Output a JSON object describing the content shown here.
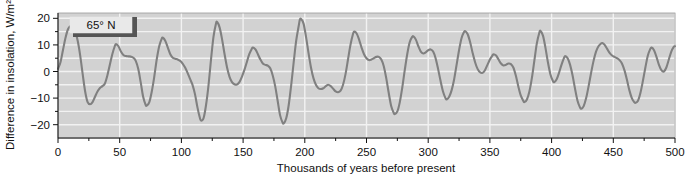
{
  "chart_data": {
    "type": "line",
    "title": "",
    "xlabel": "Thousands of years before present",
    "ylabel": "Difference in insolation, W/m²",
    "xlim": [
      0,
      500
    ],
    "ylim": [
      -25,
      22
    ],
    "xticks": [
      0,
      50,
      100,
      150,
      200,
      250,
      300,
      350,
      400,
      450,
      500
    ],
    "xtick_labels": [
      "0",
      "50",
      "100",
      "150",
      "200",
      "250",
      "300",
      "350",
      "400",
      "450",
      "500"
    ],
    "xminor_step": 25,
    "yticks": [
      -20,
      -10,
      0,
      10,
      20
    ],
    "ytick_labels": [
      "−20",
      "−10",
      "0",
      "10",
      "20"
    ],
    "yminor_step": 5,
    "grid": "horizontal-and-vertical-white-on-gray",
    "plot_background": "#d2d2d2",
    "grid_color": "#f2f2f2",
    "line_color": "#808080",
    "line_width": 2.1,
    "legend": {
      "position": "top-left-inside",
      "entries": [
        "65° N"
      ]
    },
    "annotations": [
      {
        "text": "65° N",
        "x": 22,
        "y": 17.5
      }
    ],
    "series": [
      {
        "name": "65° N",
        "points": [
          [
            0,
            1.0
          ],
          [
            2,
            3.5
          ],
          [
            4,
            8.0
          ],
          [
            6,
            12.5
          ],
          [
            8,
            15.8
          ],
          [
            10,
            17.0
          ],
          [
            12,
            16.8
          ],
          [
            14,
            15.0
          ],
          [
            16,
            11.5
          ],
          [
            18,
            6.0
          ],
          [
            20,
            -1.0
          ],
          [
            22,
            -7.5
          ],
          [
            24,
            -11.5
          ],
          [
            26,
            -12.3
          ],
          [
            28,
            -11.5
          ],
          [
            30,
            -9.5
          ],
          [
            32,
            -7.5
          ],
          [
            34,
            -6.2
          ],
          [
            36,
            -5.5
          ],
          [
            38,
            -4.5
          ],
          [
            40,
            -1.5
          ],
          [
            42,
            2.5
          ],
          [
            44,
            6.5
          ],
          [
            46,
            9.5
          ],
          [
            47,
            10.3
          ],
          [
            49,
            9.5
          ],
          [
            51,
            7.5
          ],
          [
            53,
            6.2
          ],
          [
            55,
            5.8
          ],
          [
            57,
            5.7
          ],
          [
            59,
            5.6
          ],
          [
            61,
            5.2
          ],
          [
            63,
            4.0
          ],
          [
            65,
            1.0
          ],
          [
            67,
            -4.0
          ],
          [
            69,
            -9.5
          ],
          [
            71,
            -12.5
          ],
          [
            72,
            -12.8
          ],
          [
            74,
            -11.5
          ],
          [
            76,
            -7.5
          ],
          [
            78,
            -2.0
          ],
          [
            80,
            4.5
          ],
          [
            82,
            9.5
          ],
          [
            84,
            12.3
          ],
          [
            85,
            12.7
          ],
          [
            87,
            11.5
          ],
          [
            89,
            9.0
          ],
          [
            91,
            6.5
          ],
          [
            93,
            5.2
          ],
          [
            95,
            4.8
          ],
          [
            97,
            4.5
          ],
          [
            99,
            4.0
          ],
          [
            101,
            3.0
          ],
          [
            103,
            1.5
          ],
          [
            105,
            -0.5
          ],
          [
            107,
            -2.8
          ],
          [
            109,
            -5.0
          ],
          [
            111,
            -8.5
          ],
          [
            113,
            -13.5
          ],
          [
            115,
            -17.5
          ],
          [
            116,
            -18.5
          ],
          [
            118,
            -17.5
          ],
          [
            120,
            -12.5
          ],
          [
            122,
            -5.0
          ],
          [
            124,
            4.5
          ],
          [
            126,
            13.0
          ],
          [
            128,
            18.0
          ],
          [
            129,
            18.6
          ],
          [
            131,
            16.5
          ],
          [
            133,
            12.0
          ],
          [
            135,
            6.5
          ],
          [
            137,
            1.5
          ],
          [
            139,
            -2.0
          ],
          [
            141,
            -4.0
          ],
          [
            143,
            -4.8
          ],
          [
            145,
            -4.9
          ],
          [
            147,
            -4.0
          ],
          [
            149,
            -2.0
          ],
          [
            151,
            0.5
          ],
          [
            153,
            3.5
          ],
          [
            155,
            6.5
          ],
          [
            157,
            8.5
          ],
          [
            158,
            9.0
          ],
          [
            160,
            8.3
          ],
          [
            162,
            6.5
          ],
          [
            164,
            4.5
          ],
          [
            166,
            3.0
          ],
          [
            168,
            2.5
          ],
          [
            170,
            2.2
          ],
          [
            172,
            1.2
          ],
          [
            174,
            -1.5
          ],
          [
            176,
            -5.5
          ],
          [
            178,
            -11.0
          ],
          [
            180,
            -16.5
          ],
          [
            182,
            -19.2
          ],
          [
            183,
            -19.5
          ],
          [
            185,
            -17.5
          ],
          [
            187,
            -12.5
          ],
          [
            189,
            -5.0
          ],
          [
            191,
            3.5
          ],
          [
            193,
            11.5
          ],
          [
            195,
            17.0
          ],
          [
            196,
            19.5
          ],
          [
            197,
            19.8
          ],
          [
            199,
            18.0
          ],
          [
            201,
            13.0
          ],
          [
            203,
            7.0
          ],
          [
            205,
            1.5
          ],
          [
            207,
            -2.5
          ],
          [
            209,
            -5.0
          ],
          [
            211,
            -6.3
          ],
          [
            213,
            -6.6
          ],
          [
            215,
            -6.3
          ],
          [
            217,
            -5.5
          ],
          [
            219,
            -5.0
          ],
          [
            221,
            -5.5
          ],
          [
            223,
            -6.5
          ],
          [
            225,
            -7.5
          ],
          [
            227,
            -7.8
          ],
          [
            229,
            -7.2
          ],
          [
            231,
            -5.0
          ],
          [
            233,
            -1.0
          ],
          [
            235,
            4.5
          ],
          [
            237,
            10.0
          ],
          [
            239,
            14.0
          ],
          [
            240,
            15.0
          ],
          [
            242,
            14.3
          ],
          [
            244,
            12.0
          ],
          [
            246,
            9.0
          ],
          [
            248,
            6.5
          ],
          [
            250,
            5.0
          ],
          [
            252,
            4.3
          ],
          [
            254,
            4.5
          ],
          [
            256,
            5.0
          ],
          [
            258,
            5.5
          ],
          [
            260,
            5.5
          ],
          [
            262,
            4.5
          ],
          [
            264,
            2.0
          ],
          [
            266,
            -2.5
          ],
          [
            268,
            -8.0
          ],
          [
            270,
            -13.0
          ],
          [
            272,
            -15.5
          ],
          [
            273,
            -16.0
          ],
          [
            275,
            -15.0
          ],
          [
            277,
            -11.5
          ],
          [
            279,
            -6.0
          ],
          [
            281,
            0.5
          ],
          [
            283,
            6.5
          ],
          [
            285,
            11.0
          ],
          [
            287,
            13.0
          ],
          [
            288,
            13.2
          ],
          [
            290,
            12.0
          ],
          [
            292,
            9.5
          ],
          [
            294,
            7.5
          ],
          [
            296,
            6.8
          ],
          [
            298,
            7.2
          ],
          [
            300,
            8.0
          ],
          [
            302,
            8.3
          ],
          [
            304,
            7.5
          ],
          [
            306,
            5.0
          ],
          [
            308,
            1.0
          ],
          [
            310,
            -3.5
          ],
          [
            312,
            -7.5
          ],
          [
            314,
            -10.0
          ],
          [
            315,
            -10.5
          ],
          [
            317,
            -9.5
          ],
          [
            319,
            -7.0
          ],
          [
            321,
            -3.0
          ],
          [
            323,
            2.5
          ],
          [
            325,
            8.0
          ],
          [
            327,
            12.5
          ],
          [
            329,
            14.8
          ],
          [
            330,
            15.2
          ],
          [
            332,
            14.0
          ],
          [
            334,
            11.0
          ],
          [
            336,
            7.0
          ],
          [
            338,
            3.5
          ],
          [
            340,
            1.0
          ],
          [
            342,
            -0.3
          ],
          [
            344,
            -0.5
          ],
          [
            346,
            0.5
          ],
          [
            348,
            2.5
          ],
          [
            350,
            4.5
          ],
          [
            352,
            6.0
          ],
          [
            353,
            6.5
          ],
          [
            355,
            6.0
          ],
          [
            357,
            4.5
          ],
          [
            359,
            3.0
          ],
          [
            361,
            2.3
          ],
          [
            363,
            2.5
          ],
          [
            365,
            3.0
          ],
          [
            367,
            2.8
          ],
          [
            369,
            1.5
          ],
          [
            371,
            -1.5
          ],
          [
            373,
            -5.5
          ],
          [
            375,
            -9.0
          ],
          [
            377,
            -11.0
          ],
          [
            378,
            -11.5
          ],
          [
            380,
            -10.5
          ],
          [
            382,
            -7.5
          ],
          [
            384,
            -2.5
          ],
          [
            386,
            4.0
          ],
          [
            388,
            10.5
          ],
          [
            390,
            14.5
          ],
          [
            391,
            15.3
          ],
          [
            393,
            13.5
          ],
          [
            395,
            9.0
          ],
          [
            397,
            3.5
          ],
          [
            399,
            -1.0
          ],
          [
            401,
            -3.5
          ],
          [
            402,
            -4.0
          ],
          [
            404,
            -3.0
          ],
          [
            406,
            -0.5
          ],
          [
            408,
            2.5
          ],
          [
            410,
            5.0
          ],
          [
            411,
            5.8
          ],
          [
            413,
            5.0
          ],
          [
            415,
            2.5
          ],
          [
            417,
            -1.5
          ],
          [
            419,
            -6.5
          ],
          [
            421,
            -11.0
          ],
          [
            423,
            -13.5
          ],
          [
            424,
            -14.0
          ],
          [
            426,
            -13.0
          ],
          [
            428,
            -10.0
          ],
          [
            430,
            -5.5
          ],
          [
            432,
            -0.5
          ],
          [
            434,
            4.0
          ],
          [
            436,
            7.5
          ],
          [
            438,
            9.5
          ],
          [
            440,
            10.5
          ],
          [
            441,
            10.7
          ],
          [
            443,
            10.0
          ],
          [
            445,
            8.5
          ],
          [
            447,
            7.0
          ],
          [
            449,
            6.0
          ],
          [
            451,
            5.5
          ],
          [
            453,
            5.0
          ],
          [
            455,
            4.3
          ],
          [
            457,
            3.0
          ],
          [
            459,
            0.5
          ],
          [
            461,
            -3.0
          ],
          [
            463,
            -7.0
          ],
          [
            465,
            -10.0
          ],
          [
            467,
            -11.5
          ],
          [
            468,
            -11.8
          ],
          [
            470,
            -11.0
          ],
          [
            472,
            -8.0
          ],
          [
            474,
            -3.5
          ],
          [
            476,
            1.5
          ],
          [
            478,
            6.0
          ],
          [
            480,
            8.5
          ],
          [
            481,
            9.0
          ],
          [
            483,
            8.0
          ],
          [
            485,
            5.5
          ],
          [
            487,
            2.5
          ],
          [
            489,
            0.5
          ],
          [
            491,
            0.0
          ],
          [
            493,
            1.5
          ],
          [
            495,
            4.5
          ],
          [
            497,
            7.5
          ],
          [
            499,
            9.3
          ],
          [
            500,
            9.5
          ]
        ]
      }
    ]
  },
  "legend_box": {
    "label": "65° N"
  }
}
